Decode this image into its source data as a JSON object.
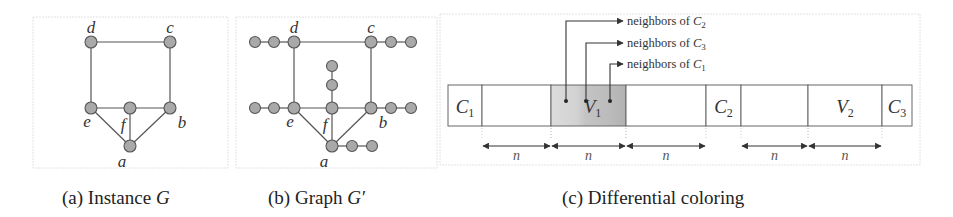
{
  "figure": {
    "panels": [
      {
        "id": "a",
        "caption_prefix": "(a) Instance ",
        "caption_var": "G",
        "vertices": [
          {
            "label": "d",
            "x": 91,
            "y": 42
          },
          {
            "label": "c",
            "x": 170,
            "y": 42
          },
          {
            "label": "e",
            "x": 91,
            "y": 108
          },
          {
            "label": "f",
            "x": 130,
            "y": 108
          },
          {
            "label": "b",
            "x": 170,
            "y": 108
          },
          {
            "label": "a",
            "x": 130,
            "y": 146
          }
        ],
        "edges": [
          [
            "d",
            "c"
          ],
          [
            "d",
            "e"
          ],
          [
            "c",
            "b"
          ],
          [
            "e",
            "f"
          ],
          [
            "f",
            "b"
          ],
          [
            "e",
            "a"
          ],
          [
            "f",
            "a"
          ],
          [
            "b",
            "a"
          ]
        ]
      },
      {
        "id": "b",
        "caption_prefix": "(b) Graph ",
        "caption_var": "G′",
        "vertices": [
          {
            "label": "d",
            "x": 294,
            "y": 42
          },
          {
            "label": "c",
            "x": 371,
            "y": 42
          },
          {
            "label": "e",
            "x": 294,
            "y": 108
          },
          {
            "label": "f",
            "x": 332,
            "y": 108
          },
          {
            "label": "b",
            "x": 371,
            "y": 108
          },
          {
            "label": "a",
            "x": 332,
            "y": 146
          }
        ],
        "edges": [
          [
            "d",
            "c"
          ],
          [
            "d",
            "e"
          ],
          [
            "c",
            "b"
          ],
          [
            "e",
            "f"
          ],
          [
            "f",
            "b"
          ],
          [
            "e",
            "a"
          ],
          [
            "f",
            "a"
          ],
          [
            "b",
            "a"
          ]
        ],
        "pendant_paths": [
          {
            "attach": "d",
            "nodes": [
              [
                274,
                42
              ],
              [
                255,
                42
              ]
            ]
          },
          {
            "attach": "c",
            "nodes": [
              [
                391,
                42
              ],
              [
                411,
                42
              ]
            ]
          },
          {
            "attach": "e",
            "nodes": [
              [
                274,
                108
              ],
              [
                255,
                108
              ]
            ]
          },
          {
            "attach": "b",
            "nodes": [
              [
                391,
                108
              ],
              [
                411,
                108
              ]
            ]
          },
          {
            "attach": "f",
            "nodes": [
              [
                332,
                85
              ],
              [
                332,
                66
              ]
            ]
          },
          {
            "attach": "a",
            "nodes": [
              [
                352,
                146
              ],
              [
                372,
                146
              ]
            ]
          }
        ]
      },
      {
        "id": "c",
        "caption": "(c) Differential coloring",
        "strip_cells": [
          {
            "label": "C",
            "sub": "1",
            "x0": 448,
            "x1": 482,
            "shaded": false
          },
          {
            "label": "",
            "sub": "",
            "x0": 482,
            "x1": 551,
            "shaded": false
          },
          {
            "label": "V",
            "sub": "1",
            "x0": 551,
            "x1": 626,
            "shaded": true
          },
          {
            "label": "",
            "sub": "",
            "x0": 626,
            "x1": 706,
            "shaded": false
          },
          {
            "label": "C",
            "sub": "2",
            "x0": 706,
            "x1": 741,
            "shaded": false
          },
          {
            "label": "",
            "sub": "",
            "x0": 741,
            "x1": 808,
            "shaded": false
          },
          {
            "label": "V",
            "sub": "2",
            "x0": 808,
            "x1": 882,
            "shaded": false
          },
          {
            "label": "C",
            "sub": "3",
            "x0": 882,
            "x1": 912,
            "shaded": false
          }
        ],
        "neighbor_pointers": [
          {
            "text": "neighbors of ",
            "var": "C",
            "sub": "2",
            "from_x": 566,
            "to_y": 21
          },
          {
            "text": "neighbors of ",
            "var": "C",
            "sub": "3",
            "from_x": 586,
            "to_y": 43
          },
          {
            "text": "neighbors of ",
            "var": "C",
            "sub": "1",
            "from_x": 610,
            "to_y": 64
          }
        ],
        "spans": [
          {
            "label": "n",
            "x0": 482,
            "x1": 551
          },
          {
            "label": "n",
            "x0": 551,
            "x1": 626
          },
          {
            "label": "n",
            "x0": 626,
            "x1": 706
          },
          {
            "label": "n",
            "x0": 741,
            "x1": 808
          },
          {
            "label": "n",
            "x0": 808,
            "x1": 882
          }
        ]
      }
    ]
  }
}
